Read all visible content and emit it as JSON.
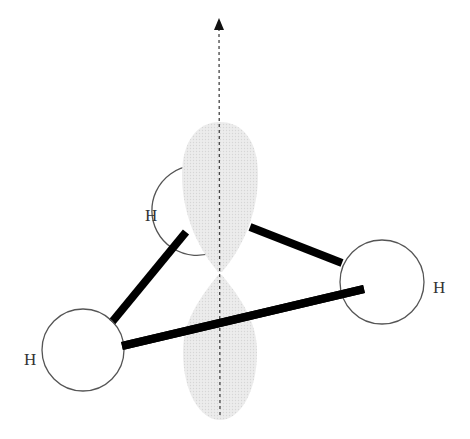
{
  "diagram": {
    "atoms": [
      {
        "id": "h-back",
        "label": "H"
      },
      {
        "id": "h-left",
        "label": "H"
      },
      {
        "id": "h-right",
        "label": "H"
      }
    ],
    "colors": {
      "bond": "#000000",
      "orbital_fill": "#e6e6e6",
      "atom_stroke": "#555555",
      "axis": "#444444"
    }
  }
}
